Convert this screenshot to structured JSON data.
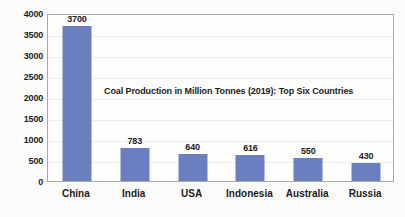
{
  "chart_data": {
    "type": "bar",
    "title": "Coal Production in Million Tonnes (2019): Top Six Countries",
    "xlabel": "",
    "ylabel": "",
    "categories": [
      "China",
      "India",
      "USA",
      "Indonesia",
      "Australia",
      "Russia"
    ],
    "values": [
      3700,
      783,
      640,
      616,
      550,
      430
    ],
    "value_labels": [
      "3700",
      "783",
      "640",
      "616",
      "550",
      "430"
    ],
    "ylim": [
      0,
      4000
    ],
    "ytick_step": 500,
    "yticks": [
      0,
      500,
      1000,
      1500,
      2000,
      2500,
      3000,
      3500,
      4000
    ],
    "ytick_labels": [
      "0",
      "500",
      "1000",
      "1500",
      "2000",
      "2500",
      "3000",
      "3500",
      "4000"
    ],
    "grid": true,
    "legend": false,
    "series": [
      {
        "name": "Coal Production (Mt)",
        "color": "#6b7fc0",
        "values": [
          3700,
          783,
          640,
          616,
          550,
          430
        ]
      }
    ],
    "colors": {
      "bar": "#6b7fc0",
      "gridline": "#ececec",
      "axis_border": "#a8a8a8",
      "text": "#1b1b1b",
      "background": "#fbfbf9",
      "plot_background": "#fdfdfc"
    }
  }
}
